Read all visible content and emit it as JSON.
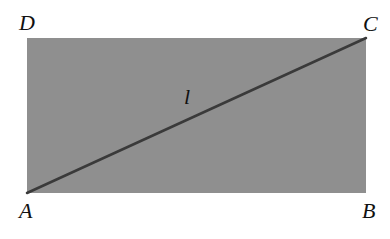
{
  "diagram": {
    "type": "rectangle-with-diagonal",
    "colors": {
      "rect_fill": "#8f8f8f",
      "diagonal": "#3a3a3a",
      "text": "#111111",
      "background": "#ffffff"
    },
    "rect": {
      "x": 27,
      "y": 38,
      "width": 339,
      "height": 155
    },
    "diagonal": {
      "from": "A",
      "to": "C",
      "label": "l"
    },
    "vertices": {
      "A": {
        "label": "A"
      },
      "B": {
        "label": "B"
      },
      "C": {
        "label": "C"
      },
      "D": {
        "label": "D"
      }
    }
  }
}
